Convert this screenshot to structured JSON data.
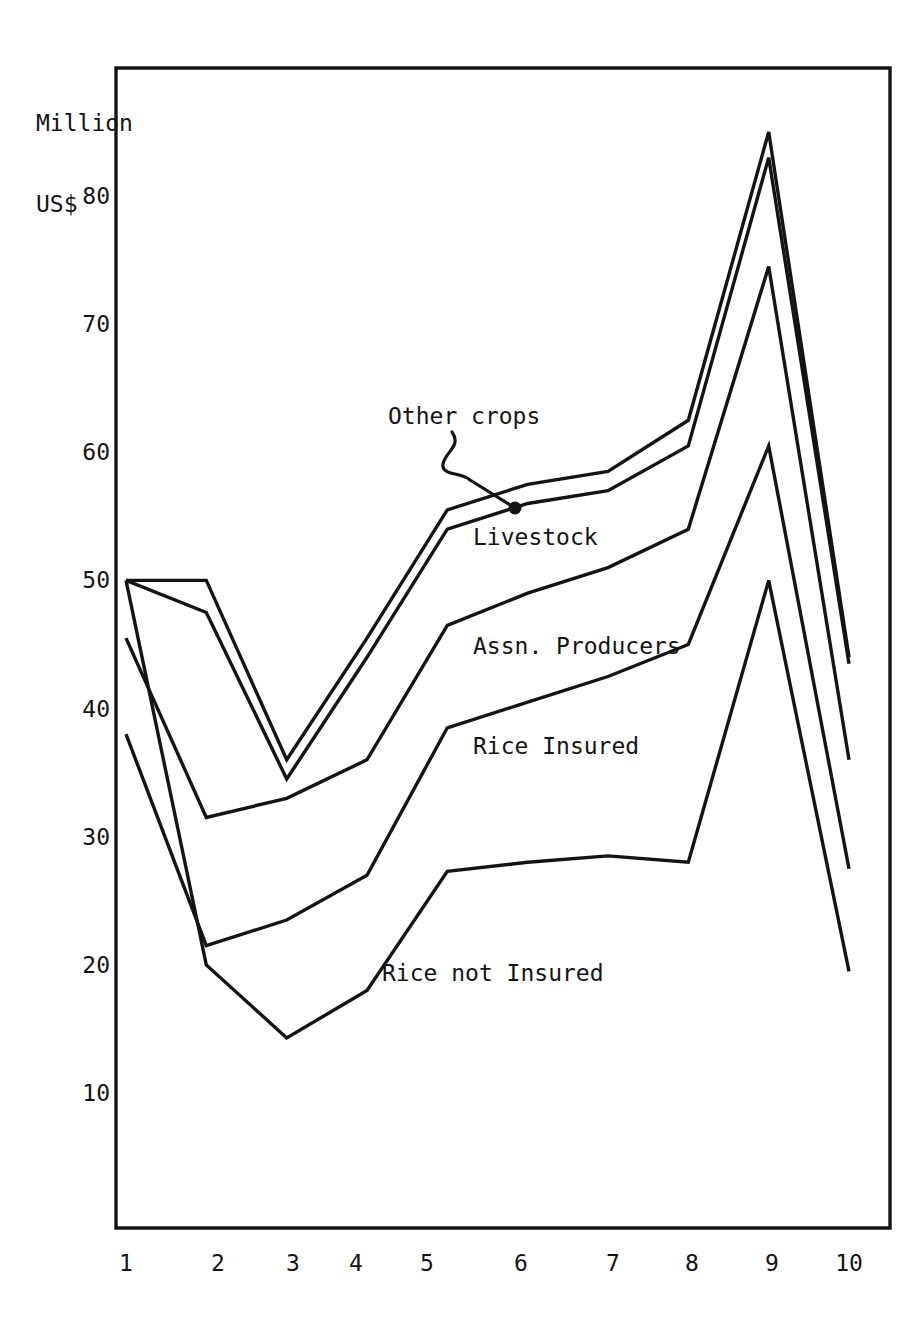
{
  "chart_data": {
    "type": "line",
    "title": "",
    "subtitle": "",
    "xlabel": "",
    "ylabel": "Million\nUS$",
    "ylabel_lines": [
      "Million",
      "US$"
    ],
    "x": [
      1,
      2,
      3,
      4,
      5,
      6,
      7,
      8,
      9,
      10
    ],
    "xtick_labels": [
      "1",
      "2",
      "3",
      "4",
      "5",
      "6",
      "7",
      "8",
      "9",
      "10"
    ],
    "ytick_labels": [
      "10",
      "20",
      "30",
      "40",
      "50",
      "60",
      "70",
      "80"
    ],
    "ytick_values": [
      10,
      20,
      30,
      40,
      50,
      60,
      70,
      80
    ],
    "ylim": [
      0,
      88
    ],
    "xlim": [
      1,
      10
    ],
    "grid": false,
    "legend_position": "inline-annotations",
    "stacked": true,
    "note": "Cumulative stacked line chart; each plotted line is the running total of the bands below it.",
    "series": [
      {
        "name": "Other crops",
        "label": "Other crops",
        "annotated": true,
        "cumulative_values": [
          50.0,
          50.0,
          36.0,
          45.5,
          55.5,
          57.5,
          58.5,
          62.5,
          85.0,
          44.0
        ]
      },
      {
        "name": "Livestock",
        "label": "Livestock",
        "annotated": true,
        "cumulative_values": [
          50.0,
          47.5,
          34.5,
          44.0,
          54.0,
          56.0,
          57.0,
          60.5,
          83.0,
          43.5
        ]
      },
      {
        "name": "Assn. Producers",
        "label": "Assn. Producers",
        "annotated": true,
        "cumulative_values": [
          45.5,
          31.5,
          33.0,
          36.0,
          46.5,
          49.0,
          51.0,
          54.0,
          74.5,
          36.0
        ]
      },
      {
        "name": "Rice Insured",
        "label": "Rice Insured",
        "annotated": true,
        "cumulative_values": [
          38.0,
          21.5,
          23.5,
          27.0,
          38.5,
          40.5,
          42.5,
          45.0,
          60.5,
          27.5
        ]
      },
      {
        "name": "Rice not Insured",
        "label": "Rice not Insured",
        "annotated": true,
        "cumulative_values": [
          50.0,
          20.0,
          14.3,
          18.0,
          27.3,
          28.0,
          28.5,
          28.0,
          50.0,
          19.5
        ]
      }
    ],
    "annotations": [
      {
        "text": "Other crops",
        "has_leader_line": true,
        "points_to_series": "Other crops"
      },
      {
        "text": "Livestock",
        "has_leader_line": false
      },
      {
        "text": "Assn. Producers",
        "has_leader_line": false
      },
      {
        "text": "Rice Insured",
        "has_leader_line": false
      },
      {
        "text": "Rice not Insured",
        "has_leader_line": false
      }
    ],
    "colors": {
      "line": "#141414",
      "axis": "#141414",
      "background": "#ffffff",
      "text": "#141414"
    }
  }
}
